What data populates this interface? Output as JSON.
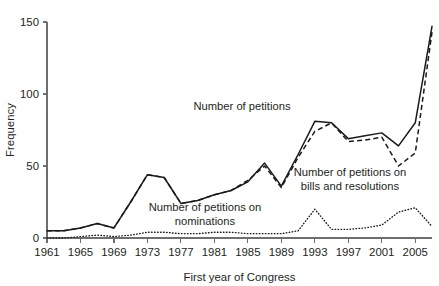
{
  "chart_data": {
    "type": "line",
    "title": "",
    "xlabel": "First year of Congress",
    "ylabel": "Frequency",
    "xlim": [
      1961,
      2007
    ],
    "ylim": [
      0,
      150
    ],
    "grid": false,
    "legend_position": "inline-annotations",
    "x": [
      1961,
      1963,
      1965,
      1967,
      1969,
      1971,
      1973,
      1975,
      1977,
      1979,
      1981,
      1983,
      1985,
      1987,
      1989,
      1991,
      1993,
      1995,
      1997,
      1999,
      2001,
      2003,
      2005,
      2007
    ],
    "x_ticks": [
      1961,
      1965,
      1969,
      1973,
      1977,
      1981,
      1985,
      1989,
      1993,
      1997,
      2001,
      2005
    ],
    "x_tick_labels": [
      "1961",
      "1965",
      "1969",
      "1973",
      "1977",
      "1981",
      "1985",
      "1989",
      "1993",
      "1997",
      "2001",
      "2005"
    ],
    "y_ticks": [
      0,
      50,
      100,
      150
    ],
    "y_tick_labels": [
      "0",
      "50",
      "100",
      "150"
    ],
    "series": [
      {
        "name": "Number of petitions",
        "style": "solid",
        "values": [
          5,
          5,
          7,
          10,
          7,
          25,
          44,
          42,
          24,
          26,
          30,
          33,
          39,
          52,
          36,
          58,
          81,
          80,
          69,
          71,
          73,
          64,
          80,
          147
        ]
      },
      {
        "name": "Number of petitions on bills and resolutions",
        "style": "dashed",
        "values": [
          5,
          5,
          7,
          10,
          7,
          25,
          44,
          42,
          24,
          26,
          30,
          33,
          40,
          50,
          35,
          56,
          74,
          80,
          67,
          68,
          70,
          50,
          59,
          143
        ]
      },
      {
        "name": "Number of petitions on nominations",
        "style": "dotted",
        "values": [
          0,
          0,
          1,
          2,
          1,
          2,
          4,
          4,
          3,
          3,
          4,
          4,
          3,
          3,
          3,
          5,
          20,
          6,
          6,
          7,
          9,
          18,
          21,
          8
        ]
      }
    ],
    "annotations": [
      {
        "id": "annot-petitions",
        "text": "Number of petitions",
        "x_px": 190,
        "y_px": 110
      },
      {
        "id": "annot-bills",
        "text_line1": "Number of petitions on",
        "text_line2": "bills and resolutions",
        "x_px": 290,
        "y_px": 176
      },
      {
        "id": "annot-nominations",
        "text_line1": "Number of petitions on",
        "text_line2": "nominations",
        "x_px": 150,
        "y_px": 211
      }
    ],
    "colors": {
      "line": "#1a1a1a",
      "axis": "#6d6e71",
      "text": "#231f20",
      "background": "#ffffff"
    }
  }
}
